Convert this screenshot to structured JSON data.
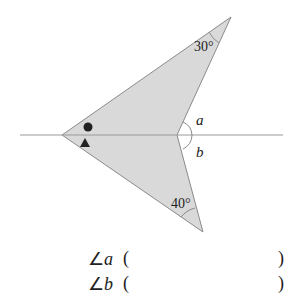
{
  "diagram": {
    "labels": {
      "top_angle": "30°",
      "bottom_angle": "40°",
      "angle_a": "a",
      "angle_b": "b"
    },
    "markers": {
      "upper_left_marker": "circle",
      "lower_left_marker": "triangle"
    },
    "colors": {
      "fill": "#d9d9d9",
      "stroke": "#8a8a8a",
      "line": "#999999",
      "text": "#222222"
    }
  },
  "questions": [
    {
      "symbol": "∠",
      "var": "a",
      "open": "(",
      "close": ")"
    },
    {
      "symbol": "∠",
      "var": "b",
      "open": "(",
      "close": ")"
    }
  ]
}
